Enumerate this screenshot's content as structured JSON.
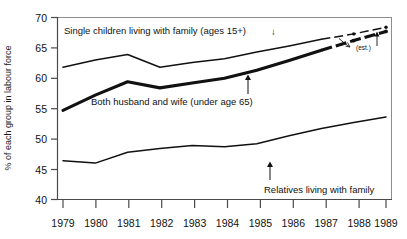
{
  "chart_data": {
    "type": "line",
    "title": "",
    "subtitle": "",
    "xlabel": "",
    "ylabel": "% of each group in labour force",
    "x": [
      1979,
      1980,
      1981,
      1982,
      1983,
      1984,
      1985,
      1986,
      1987,
      1988,
      1989
    ],
    "xtick_labels": [
      "1979",
      "1980",
      "1981",
      "1982",
      "1983",
      "1984",
      "1985",
      "1986",
      "1987",
      "1988",
      "1989"
    ],
    "ytick_labels": [
      "40",
      "45",
      "50",
      "55",
      "60",
      "65",
      "70"
    ],
    "yticks": [
      40,
      45,
      50,
      55,
      60,
      65,
      70
    ],
    "ylim": [
      40,
      70
    ],
    "xlim": [
      1979,
      1989
    ],
    "grid": false,
    "legend_position": "inline-annotations",
    "series": [
      {
        "name": "Single children living with family (ages 15+)",
        "line_style": "thin",
        "values": [
          61.8,
          63.0,
          63.9,
          61.8,
          62.6,
          63.2,
          64.3,
          65.3,
          66.4,
          67.3,
          68.4
        ],
        "estimated_from": 1988
      },
      {
        "name": "Both husband and wife (under age 65)",
        "line_style": "thick",
        "values": [
          54.7,
          57.2,
          59.4,
          58.4,
          59.2,
          60.0,
          61.3,
          62.9,
          64.6,
          66.2,
          67.7
        ],
        "estimated_from": 1988
      },
      {
        "name": "Relatives living with family",
        "line_style": "thin",
        "values": [
          46.4,
          46.0,
          47.8,
          48.4,
          48.9,
          48.7,
          49.2,
          50.5,
          51.7,
          52.7,
          53.6
        ],
        "estimated_from": null
      }
    ],
    "annotations": [
      {
        "id": "single-children",
        "text": "Single children living with family (ages 15+) ↓"
      },
      {
        "id": "husband-wife",
        "text": "Both husband and wife (under age 65)"
      },
      {
        "id": "relatives",
        "text": "Relatives living with family"
      },
      {
        "id": "estimate",
        "text": "(est.)"
      }
    ],
    "colors": {
      "line": "#111111",
      "axis": "#6d6d6d",
      "frame": "#8a8a8a",
      "background": "#ffffff",
      "text": "#111111"
    }
  },
  "axis": {
    "y_title": "% of each group in labour force",
    "y_ticks": [
      "70",
      "65",
      "60",
      "55",
      "50",
      "45",
      "40"
    ],
    "x_ticks": [
      "1979",
      "1980",
      "1981",
      "1982",
      "1983",
      "1984",
      "1985",
      "1986",
      "1987",
      "1988",
      "1989"
    ]
  },
  "labels": {
    "single_children": "Single children living with family (ages 15+)",
    "single_children_arrow": "↓",
    "husband_wife": "Both husband and wife (under age 65)",
    "husband_wife_arrow": "↑",
    "relatives": "Relatives living with family",
    "relatives_arrow": "↑",
    "estimate": "(est.)"
  }
}
